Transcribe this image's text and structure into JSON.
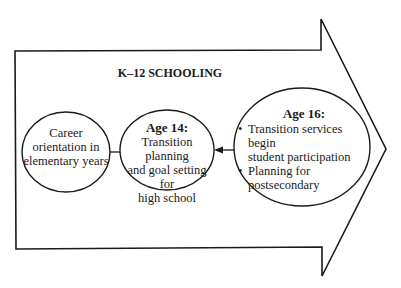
{
  "title": "K–12 SCHOOLING",
  "colors": {
    "stroke": "#1a1a1a",
    "background": "#ffffff"
  },
  "nodes": [
    {
      "id": "elementary",
      "lines": [
        "Career",
        "orientation in",
        "elementary years"
      ]
    },
    {
      "id": "age14",
      "heading": "Age 14:",
      "lines": [
        "Transition planning",
        "and goal setting for",
        "high school"
      ]
    },
    {
      "id": "age16",
      "heading": "Age 16:",
      "bullets": [
        {
          "symbol": "•",
          "lines": [
            "Transition services begin",
            "student participation"
          ]
        },
        {
          "symbol": "•",
          "lines": [
            "Planning for",
            "postsecondary"
          ]
        }
      ]
    }
  ],
  "connectors": [
    {
      "from": "elementary",
      "to": "age14",
      "type": "line"
    },
    {
      "from": "age16",
      "to": "age14",
      "type": "arrow"
    }
  ]
}
